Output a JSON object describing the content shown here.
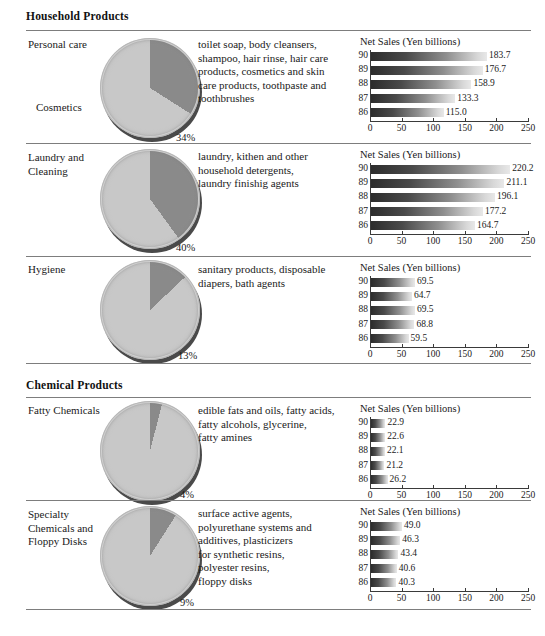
{
  "chart_data": [
    {
      "type": "bar",
      "title": "Net Sales (Yen billions)",
      "categories": [
        "90",
        "89",
        "88",
        "87",
        "86"
      ],
      "values": [
        183.7,
        176.7,
        158.9,
        133.3,
        115.0
      ],
      "xlabel": "",
      "ylabel": "",
      "xlim": [
        0,
        250
      ],
      "xticks": [
        0,
        50,
        100,
        150,
        200,
        250
      ],
      "grid": false,
      "orientation": "horizontal",
      "segment": "Personal care / Cosmetics"
    },
    {
      "type": "bar",
      "title": "Net Sales (Yen billions)",
      "categories": [
        "90",
        "89",
        "88",
        "87",
        "86"
      ],
      "values": [
        220.2,
        211.1,
        196.1,
        177.2,
        164.7
      ],
      "xlabel": "",
      "ylabel": "",
      "xlim": [
        0,
        250
      ],
      "xticks": [
        0,
        50,
        100,
        150,
        200,
        250
      ],
      "grid": false,
      "orientation": "horizontal",
      "segment": "Laundry and Cleaning"
    },
    {
      "type": "bar",
      "title": "Net Sales (Yen billions)",
      "categories": [
        "90",
        "89",
        "88",
        "87",
        "86"
      ],
      "values": [
        69.5,
        64.7,
        69.5,
        68.8,
        59.5
      ],
      "xlabel": "",
      "ylabel": "",
      "xlim": [
        0,
        250
      ],
      "xticks": [
        0,
        50,
        100,
        150,
        200,
        250
      ],
      "grid": false,
      "orientation": "horizontal",
      "segment": "Hygiene"
    },
    {
      "type": "bar",
      "title": "Net Sales (Yen billions)",
      "categories": [
        "90",
        "89",
        "88",
        "87",
        "86"
      ],
      "values": [
        22.9,
        22.6,
        22.1,
        21.2,
        26.2
      ],
      "xlabel": "",
      "ylabel": "",
      "xlim": [
        0,
        250
      ],
      "xticks": [
        0,
        50,
        100,
        150,
        200,
        250
      ],
      "grid": false,
      "orientation": "horizontal",
      "segment": "Fatty Chemicals"
    },
    {
      "type": "bar",
      "title": "Net Sales (Yen billions)",
      "categories": [
        "90",
        "89",
        "88",
        "87",
        "86"
      ],
      "values": [
        49.0,
        46.3,
        43.4,
        40.6,
        40.3
      ],
      "xlabel": "",
      "ylabel": "",
      "xlim": [
        0,
        250
      ],
      "xticks": [
        0,
        50,
        100,
        150,
        200,
        250
      ],
      "grid": false,
      "orientation": "horizontal",
      "segment": "Specialty Chemicals and Floppy Disks"
    }
  ],
  "pie_data": [
    {
      "segment": "Personal care / Cosmetics",
      "share_pct": 34,
      "label": "34%"
    },
    {
      "segment": "Laundry and Cleaning",
      "share_pct": 40,
      "label": "40%"
    },
    {
      "segment": "Hygiene",
      "share_pct": 13,
      "label": "13%"
    },
    {
      "segment": "Fatty Chemicals",
      "share_pct": 4,
      "label": "4%"
    },
    {
      "segment": "Specialty Chemicals and Floppy Disks",
      "share_pct": 9,
      "label": "9%"
    }
  ],
  "colors": {
    "slice_highlight": "#8a8a8a",
    "slice_rest": "#c8c8c8",
    "pie_rim": "#cfcfcf",
    "pie_shadow": "#4a4a4a",
    "rule": "#7d7d7d",
    "text": "#1a1a1a",
    "bar_dark": "#2c2c2c",
    "bar_light": "#e8e8e8"
  },
  "groups": [
    {
      "title": "Household Products"
    },
    {
      "title": "Chemical Products"
    }
  ],
  "rows": [
    {
      "id": "personal-care",
      "label_top": "Personal care",
      "label_bottom": "Cosmetics",
      "pct": "34%",
      "description": "toilet soap, body cleansers,\nshampoo, hair rinse, hair care\nproducts, cosmetics and skin\ncare products, toothpaste and\ntoothbrushes",
      "chart_title": "Net Sales (Yen billions)",
      "bars": [
        {
          "year": "90",
          "value": 183.7,
          "value_label": "183.7"
        },
        {
          "year": "89",
          "value": 176.7,
          "value_label": "176.7"
        },
        {
          "year": "88",
          "value": 158.9,
          "value_label": "158.9"
        },
        {
          "year": "87",
          "value": 133.3,
          "value_label": "133.3"
        },
        {
          "year": "86",
          "value": 115.0,
          "value_label": "115.0"
        }
      ],
      "axis_labels": [
        "0",
        "50",
        "100",
        "150",
        "200",
        "250"
      ]
    },
    {
      "id": "laundry-and-cleaning",
      "label_top": "Laundry and\nCleaning",
      "label_bottom": "",
      "pct": "40%",
      "description": "laundry, kithen and other\nhousehold detergents,\nlaundry finishig agents",
      "chart_title": "Net Sales (Yen billions)",
      "bars": [
        {
          "year": "90",
          "value": 220.2,
          "value_label": "220.2"
        },
        {
          "year": "89",
          "value": 211.1,
          "value_label": "211.1"
        },
        {
          "year": "88",
          "value": 196.1,
          "value_label": "196.1"
        },
        {
          "year": "87",
          "value": 177.2,
          "value_label": "177.2"
        },
        {
          "year": "86",
          "value": 164.7,
          "value_label": "164.7"
        }
      ],
      "axis_labels": [
        "0",
        "50",
        "100",
        "150",
        "200",
        "250"
      ]
    },
    {
      "id": "hygiene",
      "label_top": "Hygiene",
      "label_bottom": "",
      "pct": "13%",
      "description": "sanitary products, disposable\ndiapers, bath agents",
      "chart_title": "Net Sales (Yen billions)",
      "bars": [
        {
          "year": "90",
          "value": 69.5,
          "value_label": "69.5"
        },
        {
          "year": "89",
          "value": 64.7,
          "value_label": "64.7"
        },
        {
          "year": "88",
          "value": 69.5,
          "value_label": "69.5"
        },
        {
          "year": "87",
          "value": 68.8,
          "value_label": "68.8"
        },
        {
          "year": "86",
          "value": 59.5,
          "value_label": "59.5"
        }
      ],
      "axis_labels": [
        "0",
        "50",
        "100",
        "150",
        "200",
        "250"
      ]
    },
    {
      "id": "fatty-chemicals",
      "label_top": "Fatty Chemicals",
      "label_bottom": "",
      "pct": "4%",
      "description": "edible fats and oils, fatty acids,\nfatty alcohols, glycerine,\nfatty amines",
      "chart_title": "Net Sales (Yen billions)",
      "bars": [
        {
          "year": "90",
          "value": 22.9,
          "value_label": "22.9"
        },
        {
          "year": "89",
          "value": 22.6,
          "value_label": "22.6"
        },
        {
          "year": "88",
          "value": 22.1,
          "value_label": "22.1"
        },
        {
          "year": "87",
          "value": 21.2,
          "value_label": "21.2"
        },
        {
          "year": "86",
          "value": 26.2,
          "value_label": "26.2"
        }
      ],
      "axis_labels": [
        "0",
        "50",
        "100",
        "150",
        "200",
        "250"
      ]
    },
    {
      "id": "specialty-chemicals",
      "label_top": "Specialty\nChemicals and\nFloppy Disks",
      "label_bottom": "",
      "pct": "9%",
      "description": "surface active agents,\npolyurethane systems and\nadditives, plasticizers\nfor synthetic resins,\npolyester resins,\nfloppy disks",
      "chart_title": "Net Sales (Yen billions)",
      "bars": [
        {
          "year": "90",
          "value": 49.0,
          "value_label": "49.0"
        },
        {
          "year": "89",
          "value": 46.3,
          "value_label": "46.3"
        },
        {
          "year": "88",
          "value": 43.4,
          "value_label": "43.4"
        },
        {
          "year": "87",
          "value": 40.6,
          "value_label": "40.6"
        },
        {
          "year": "86",
          "value": 40.3,
          "value_label": "40.3"
        }
      ],
      "axis_labels": [
        "0",
        "50",
        "100",
        "150",
        "200",
        "250"
      ]
    }
  ]
}
